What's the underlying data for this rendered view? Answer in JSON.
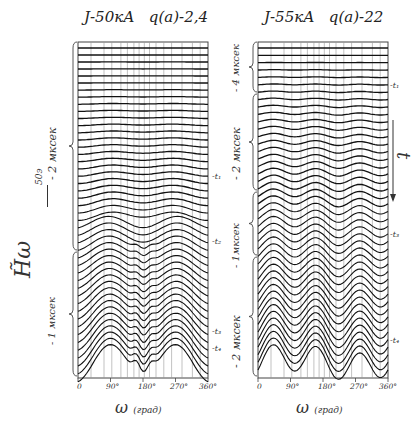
{
  "chart_data": [
    {
      "type": "line",
      "title": "J-50кА  q(a)-2,4",
      "title_parts": {
        "current": "J-50кА",
        "q": "q(a)-2,4"
      },
      "xlabel": "ω (град)",
      "ylabel": "H̃ω",
      "y_scale_label": "50э",
      "x_ticks": [
        "0",
        "90°",
        "180°",
        "270°",
        "360°"
      ],
      "xlim": [
        0,
        360
      ],
      "grid": true,
      "time_brackets": [
        "- 2 мксек",
        "- 1 мксек"
      ],
      "time_markers": [
        "t1",
        "t2",
        "t3",
        "t4"
      ],
      "series_count": 46,
      "description": "Stacked waterfall of H-omega vs poloidal angle; early traces nearly flat, later traces develop peaks near 0°/360°, ~160°, ~200° and ~290°, with dips near 70° and 260°"
    },
    {
      "type": "line",
      "title": "J-55кА  q(a)-22",
      "title_parts": {
        "current": "J-55кА",
        "q": "q(a)-22"
      },
      "xlabel": "ω (град)",
      "x_ticks": [
        "0",
        "90°",
        "180°",
        "270°",
        "360°"
      ],
      "xlim": [
        0,
        360
      ],
      "grid": true,
      "time_brackets": [
        "- 4 мксек",
        "- 2 мксек",
        "- 1мксек",
        "- 2 мксек"
      ],
      "time_markers": [
        "t1",
        "t3",
        "t4"
      ],
      "time_arrow_label": "t",
      "series_count": 44,
      "description": "Stacked waterfall; structure develops with m≈3 modulation, peaks near 90°–120°, 180° and 300°, strong deepening dips near 40°, 150°, 230°"
    }
  ],
  "left": {
    "title_main": "J-50кА",
    "title_q": "q(a)-2,4",
    "ylabel": "H̃ω",
    "yscale": "50э",
    "brace_top": "- 2 мксек",
    "brace_bottom": "- 1 мксек",
    "t_markers": [
      "-t₁",
      "-t₂",
      "-t₃",
      "-t₄"
    ],
    "x_ticks": [
      "0",
      "90°",
      "180°",
      "270°",
      "360°"
    ],
    "xlabel_omega": "ω",
    "xlabel_unit": "(град)"
  },
  "right": {
    "title_main": "J-55кА",
    "title_q": "q(a)-22",
    "braces": [
      "- 4 мксек",
      "- 2 мксек",
      "- 1мксек",
      "- 2 мксек"
    ],
    "t_markers": [
      "-t₁",
      "-t₃",
      "-t₄"
    ],
    "time_arrow": "t",
    "x_ticks": [
      "0",
      "90°",
      "180°",
      "270°",
      "360°"
    ],
    "xlabel_omega": "ω",
    "xlabel_unit": "(град)"
  }
}
